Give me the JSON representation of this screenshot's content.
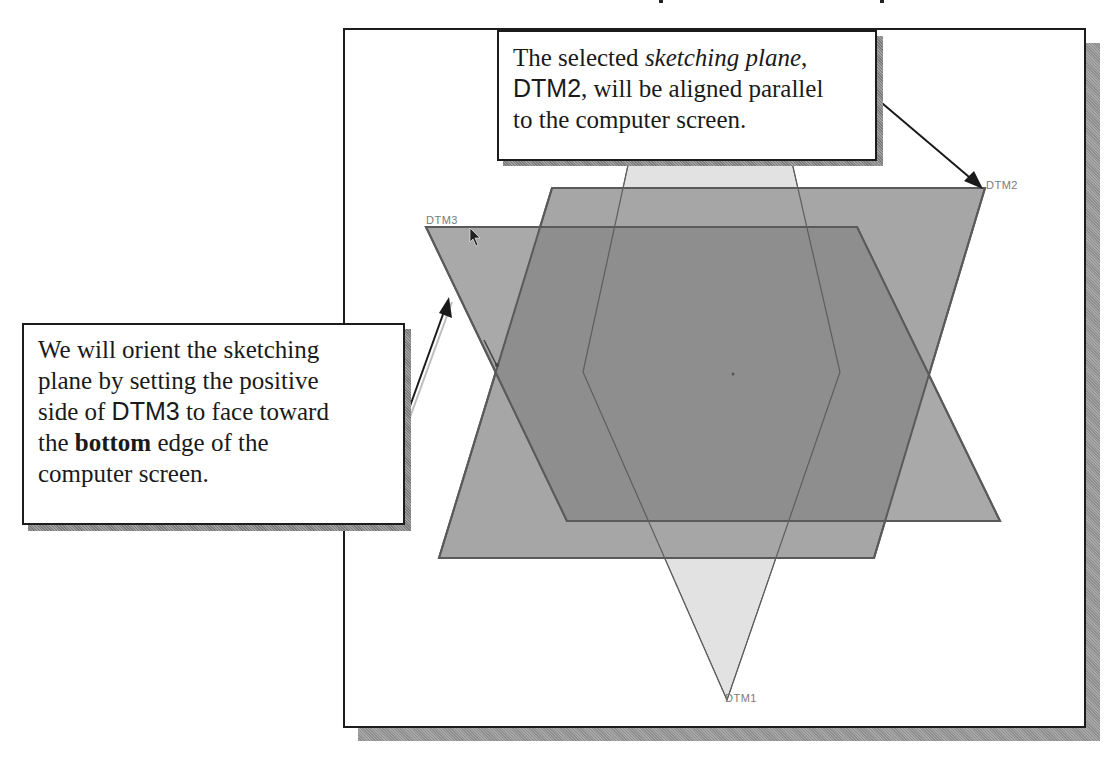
{
  "figure": {
    "colors": {
      "frame_border": "#1c1c1c",
      "frame_shadow": "#9a9a9a",
      "plane_dtm1_fill": "#e2e2e2",
      "plane_dtm2_fill": "#a6a6a6",
      "plane_dtm3_fill": "#a9a9a9",
      "plane_overlap_fill": "#8c8c8c",
      "plane_edge": "#5a5a5a",
      "label_color": "#7a7a7a"
    }
  },
  "planes": {
    "dtm1": {
      "label": "DTM1"
    },
    "dtm2": {
      "label": "DTM2"
    },
    "dtm3": {
      "label": "DTM3"
    }
  },
  "callouts": {
    "top": {
      "line1_a": "The selected ",
      "line1_italic": "sketching plane",
      "line1_b": ",",
      "line2_sans": "DTM2",
      "line2_b": ", will be aligned parallel",
      "line3": "to the computer screen."
    },
    "left": {
      "line1": "We will orient the sketching",
      "line2": "plane by setting the positive",
      "line3_a": "side of ",
      "line3_sans": "DTM3",
      "line3_b": " to face toward",
      "line4_a": "the ",
      "line4_bold": "bottom",
      "line4_b": " edge of the",
      "line5": "computer screen."
    }
  }
}
